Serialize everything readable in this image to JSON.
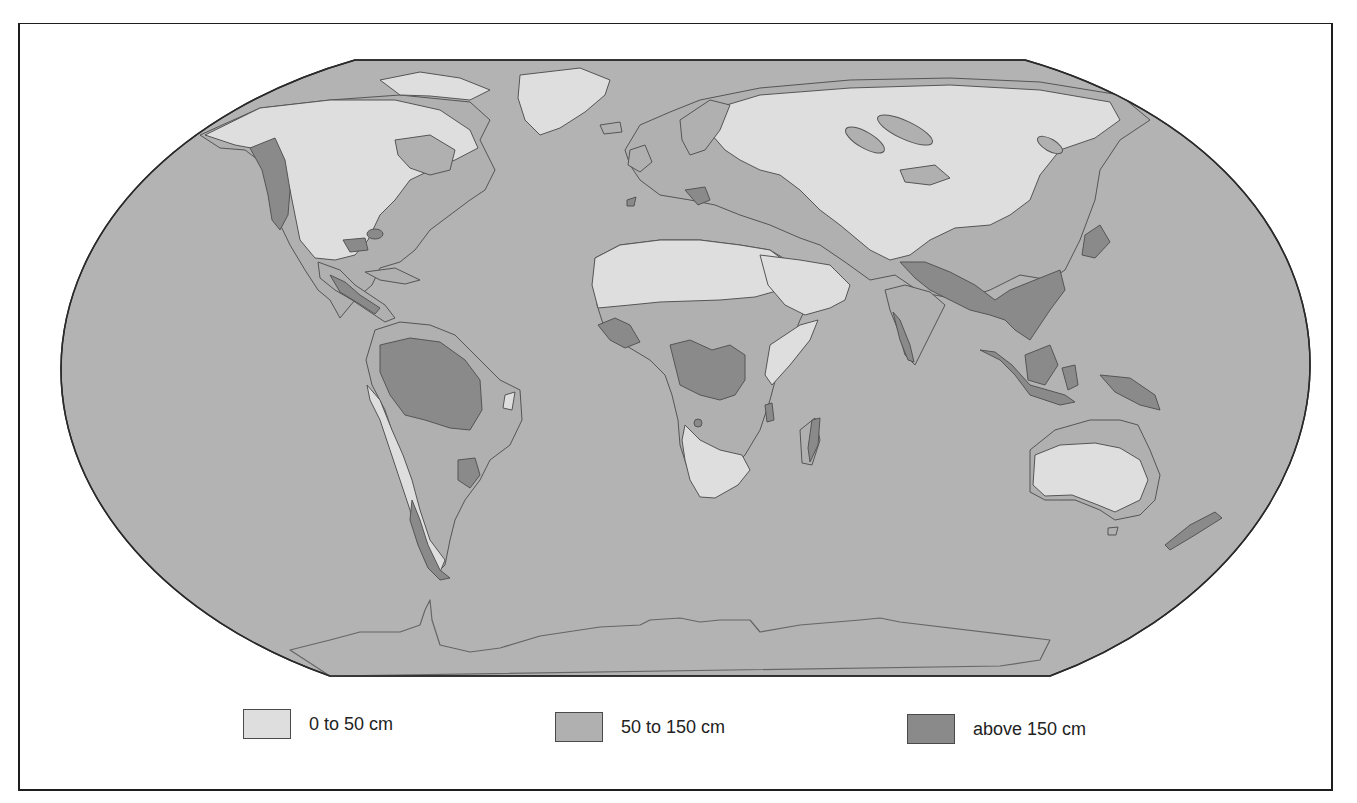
{
  "map": {
    "type": "choropleth",
    "subject": "World annual precipitation",
    "projection": "Robinson-like (flattened ellipse)",
    "colors": {
      "ocean": "#b3b3b3",
      "low": "#dedede",
      "medium": "#b0b0b0",
      "high": "#8a8a8a",
      "outline": "#3a3a3a"
    }
  },
  "legend": {
    "items": [
      {
        "label": "0 to 50 cm",
        "color": "#dedede"
      },
      {
        "label": "50 to 150 cm",
        "color": "#b0b0b0"
      },
      {
        "label": "above 150 cm",
        "color": "#8a8a8a"
      }
    ]
  }
}
